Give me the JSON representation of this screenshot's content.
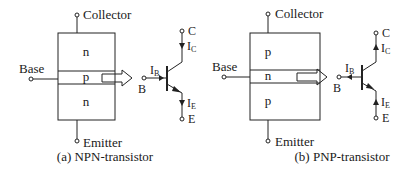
{
  "panels": [
    {
      "id": "npn",
      "caption": "(a) NPN-transistor",
      "layers": [
        "n",
        "p",
        "n"
      ],
      "terminals": {
        "collector": "Collector",
        "base": "Base",
        "emitter": "Emitter"
      },
      "symbol": {
        "type": "npn",
        "labels": {
          "base": "B",
          "collector": "C",
          "emitter": "E"
        },
        "currents": {
          "base": "I",
          "base_sub": "B",
          "collector": "I",
          "collector_sub": "C",
          "emitter": "I",
          "emitter_sub": "E"
        },
        "current_directions": {
          "base": "into-base",
          "collector": "down",
          "emitter": "down"
        }
      }
    },
    {
      "id": "pnp",
      "caption": "(b) PNP-transistor",
      "layers": [
        "p",
        "n",
        "p"
      ],
      "terminals": {
        "collector": "Collector",
        "base": "Base",
        "emitter": "Emitter"
      },
      "symbol": {
        "type": "pnp",
        "labels": {
          "base": "B",
          "collector": "C",
          "emitter": "E"
        },
        "currents": {
          "base": "I",
          "base_sub": "B",
          "collector": "I",
          "collector_sub": "C",
          "emitter": "I",
          "emitter_sub": "E"
        },
        "current_directions": {
          "base": "out-of-base",
          "collector": "up",
          "emitter": "up"
        }
      }
    }
  ],
  "arrow_icon": "hollow-right-arrow"
}
